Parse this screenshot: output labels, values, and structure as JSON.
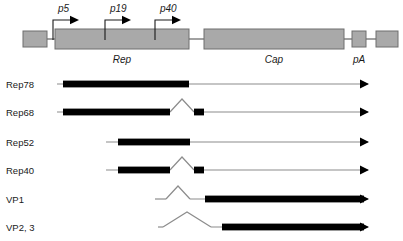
{
  "figure": {
    "colors": {
      "genome_fill": "#a9a9a9",
      "genome_stroke": "#6e6e6e",
      "transcript_thick": "#000000",
      "transcript_thin": "#8c8c8c",
      "text": "#1a1a1a",
      "background": "#ffffff"
    }
  },
  "genome": {
    "promoters": [
      {
        "label": "p5",
        "label_x": 58,
        "label_y": 12,
        "stem_x": 53,
        "arrow_y": 20
      },
      {
        "label": "p19",
        "label_x": 110,
        "label_y": 12,
        "stem_x": 105,
        "arrow_y": 20
      },
      {
        "label": "p40",
        "label_x": 160,
        "label_y": 12,
        "stem_x": 155,
        "arrow_y": 20
      },
      {
        "label": "p",
        "label_x": 0,
        "label_y": 0,
        "stem_x": 0,
        "arrow_y": 0
      }
    ],
    "features": [
      {
        "name": "itr-left",
        "label": "",
        "x": 23,
        "y": 31,
        "w": 24,
        "h": 16
      },
      {
        "name": "rep-orf",
        "label": "Rep",
        "x": 55,
        "y": 29,
        "w": 134,
        "h": 20,
        "label_x": 122,
        "label_y": 63
      },
      {
        "name": "cap-orf",
        "label": "Cap",
        "x": 204,
        "y": 29,
        "w": 140,
        "h": 20,
        "label_x": 274,
        "label_y": 63
      },
      {
        "name": "pa-site",
        "label": "pA",
        "x": 352,
        "y": 31,
        "w": 14,
        "h": 16,
        "label_x": 359,
        "label_y": 63
      },
      {
        "name": "itr-right",
        "label": "",
        "x": 376,
        "y": 31,
        "w": 22,
        "h": 16
      }
    ],
    "connectors": [
      {
        "x1": 47,
        "x2": 55,
        "y": 39
      },
      {
        "x1": 189,
        "x2": 204,
        "y": 39
      },
      {
        "x1": 344,
        "x2": 352,
        "y": 39
      },
      {
        "x1": 366,
        "x2": 376,
        "y": 39
      }
    ]
  },
  "transcripts": [
    {
      "label": "Rep78",
      "label_x": 6,
      "label_y": 88,
      "y": 84,
      "line_start": 57,
      "line_end": 368,
      "thick": [
        {
          "x1": 63,
          "x2": 189
        }
      ],
      "splice": null,
      "arrow": true
    },
    {
      "label": "Rep68",
      "label_x": 6,
      "label_y": 116,
      "y": 112,
      "line_start": 57,
      "line_end": 368,
      "thick": [
        {
          "x1": 63,
          "x2": 170
        },
        {
          "x1": 194,
          "x2": 204
        }
      ],
      "splice": {
        "x1": 170,
        "peak_x": 182,
        "x2": 194,
        "peak_y": 99
      },
      "arrow": true
    },
    {
      "label": "Rep52",
      "label_x": 6,
      "label_y": 146,
      "y": 142,
      "line_start": 106,
      "line_end": 368,
      "thick": [
        {
          "x1": 118,
          "x2": 190
        }
      ],
      "splice": null,
      "arrow": true
    },
    {
      "label": "Rep40",
      "label_x": 6,
      "label_y": 174,
      "y": 170,
      "line_start": 106,
      "line_end": 368,
      "thick": [
        {
          "x1": 118,
          "x2": 170
        },
        {
          "x1": 194,
          "x2": 204
        }
      ],
      "splice": {
        "x1": 170,
        "peak_x": 182,
        "x2": 194,
        "peak_y": 157
      },
      "arrow": true
    },
    {
      "label": "VP1",
      "label_x": 6,
      "label_y": 203,
      "y": 199,
      "line_start": 155,
      "line_end": 368,
      "thick": [
        {
          "x1": 205,
          "x2": 364
        }
      ],
      "splice": {
        "x1": 166,
        "peak_x": 178,
        "x2": 190,
        "peak_y": 186
      },
      "arrow": true
    },
    {
      "label": "VP2, 3",
      "label_x": 6,
      "label_y": 231,
      "y": 227,
      "line_start": 158,
      "line_end": 368,
      "thick": [
        {
          "x1": 222,
          "x2": 364
        }
      ],
      "splice": {
        "x1": 163,
        "peak_x": 187,
        "x2": 211,
        "peak_y": 212
      },
      "arrow": true
    }
  ]
}
